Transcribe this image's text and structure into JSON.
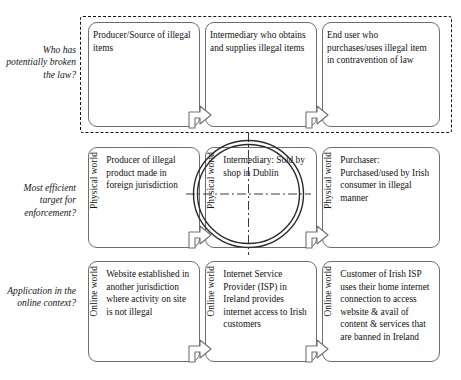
{
  "diagram": {
    "row_labels": [
      "Who has potentially broken the law?",
      "Most efficient target for enforcement?",
      "Application in the online context?"
    ],
    "rows": [
      {
        "id": "row-who-broke-law",
        "label": "Who has potentially broken the law?",
        "grouped": true,
        "nodes": [
          {
            "side_caption": "",
            "text": "Producer/Source of illegal items"
          },
          {
            "side_caption": "",
            "text": "Intermediary who obtains and supplies illegal items"
          },
          {
            "side_caption": "",
            "text": "End user who purchases/uses illegal item in contravention of law"
          }
        ]
      },
      {
        "id": "row-enforcement-target",
        "label": "Most efficient target for enforcement?",
        "grouped": false,
        "nodes": [
          {
            "side_caption": "Physical world",
            "text": "Producer of illegal product made in foreign jurisdiction"
          },
          {
            "side_caption": "Physical world",
            "text": "Intermediary: Sold by shop in Dublin"
          },
          {
            "side_caption": "Physical world",
            "text": "Purchaser: Purchased/used by Irish consumer in illegal manner"
          }
        ]
      },
      {
        "id": "row-online-context",
        "label": "Application in the online context?",
        "grouped": false,
        "nodes": [
          {
            "side_caption": "Online world",
            "text": "Website established in another jurisdiction where activity on site is not illegal"
          },
          {
            "side_caption": "Online world",
            "text": "Internet Service Provider (ISP) in Ireland provides internet access to Irish customers"
          },
          {
            "side_caption": "Online world",
            "text": "Customer of Irish ISP uses their home internet connection to access website & avail of content & services that are banned in Ireland"
          }
        ]
      }
    ],
    "annotations": {
      "target_marker": {
        "name": "enforcement-target-crosshair",
        "targets_node": "Intermediary: Sold by shop in Dublin",
        "shape": "double-ring-circle-with-crosshair"
      },
      "flow_arrows": {
        "direction": "left-to-right",
        "count": 6,
        "glyph": "open-triangle-chevron"
      }
    },
    "colors": {
      "box_border": "#6d6d6d",
      "group_border": "#111111",
      "text": "#111111",
      "background": "#ffffff",
      "circle_stroke": "#2b2b2b"
    }
  }
}
